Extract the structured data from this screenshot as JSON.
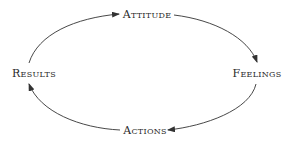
{
  "diagram": {
    "type": "cycle",
    "direction": "clockwise",
    "colors": {
      "text": "#2a2a2a",
      "arrow": "#333333",
      "background": "#ffffff"
    },
    "nodes": [
      {
        "id": "attitude",
        "label": "Attitude",
        "x": 147,
        "y": 14
      },
      {
        "id": "feelings",
        "label": "Feelings",
        "x": 257,
        "y": 73
      },
      {
        "id": "actions",
        "label": "Actions",
        "x": 145,
        "y": 130
      },
      {
        "id": "results",
        "label": "Results",
        "x": 34,
        "y": 73
      }
    ],
    "edges": [
      {
        "from": "attitude",
        "to": "feelings"
      },
      {
        "from": "feelings",
        "to": "actions"
      },
      {
        "from": "actions",
        "to": "results"
      },
      {
        "from": "results",
        "to": "attitude"
      }
    ]
  }
}
